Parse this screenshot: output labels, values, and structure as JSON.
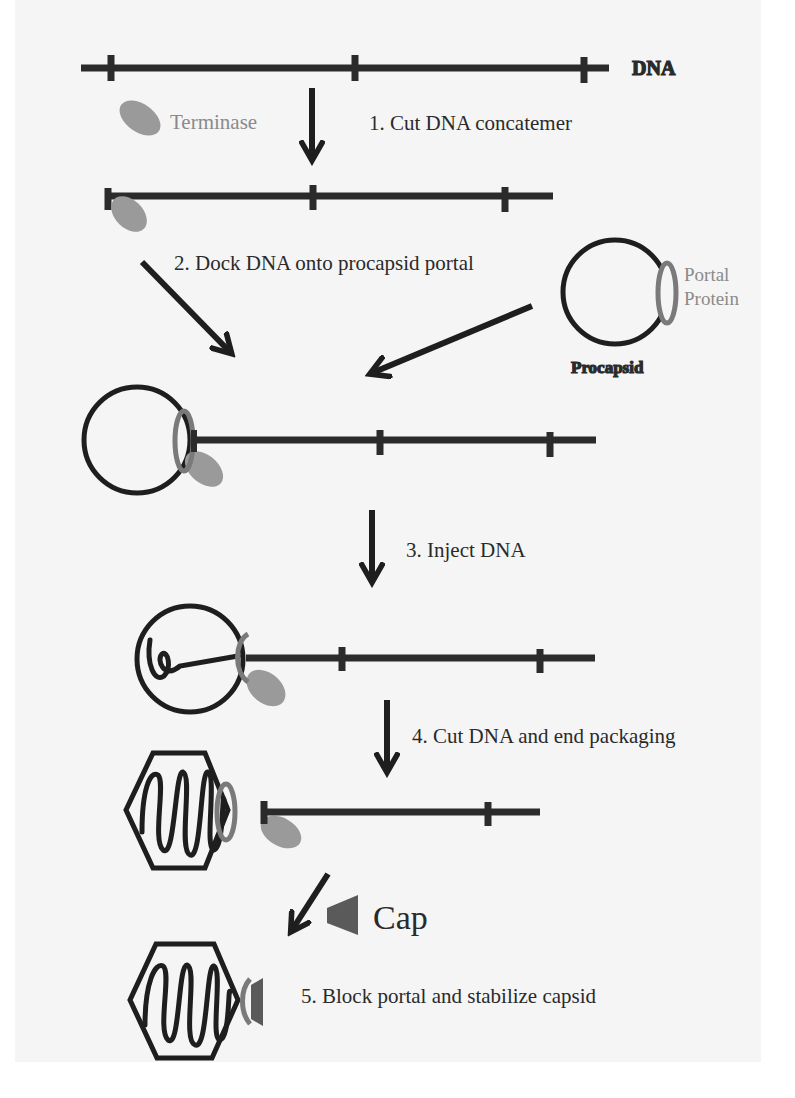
{
  "labels": {
    "dna": "DNA",
    "terminase": "Terminase",
    "portal_line1": "Portal",
    "portal_line2": "Protein",
    "procapsid": "Procapsid",
    "cap": "Cap"
  },
  "steps": [
    {
      "number": 1,
      "text": "1. Cut DNA concatemer"
    },
    {
      "number": 2,
      "text": "2. Dock DNA onto procapsid portal"
    },
    {
      "number": 3,
      "text": "3. Inject DNA"
    },
    {
      "number": 4,
      "text": "4. Cut DNA and end packaging"
    },
    {
      "number": 5,
      "text": "5. Block portal and stabilize capsid"
    }
  ],
  "colors": {
    "dna": "#2b2b2b",
    "capsid": "#1e1e1e",
    "terminase": "#9a9a9a",
    "portal": "#7a7a7a",
    "cap": "#5a5a5a",
    "background": "#f5f5f5"
  }
}
